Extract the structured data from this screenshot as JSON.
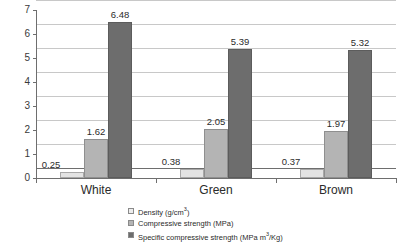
{
  "chart_data": {
    "type": "bar",
    "title": "",
    "xlabel": "",
    "ylabel": "",
    "ylim": [
      0,
      7
    ],
    "ytick_labels": [
      "0",
      "1",
      "2",
      "3",
      "4",
      "5",
      "6",
      "7"
    ],
    "grid": true,
    "legend_position": "bottom-center",
    "categories": [
      "White",
      "Green",
      "Brown"
    ],
    "series": [
      {
        "name": "Density (g/cm³)",
        "name_base": "Density (g/cm",
        "name_sup": "3",
        "name_tail": ")",
        "color": "#e3e3e3",
        "values": [
          0.25,
          0.38,
          0.37
        ],
        "labels": [
          "0.25",
          "0.38",
          "0.37"
        ]
      },
      {
        "name": "Compressive strength (MPa)",
        "name_base": "Compressive strength (MPa)",
        "name_sup": "",
        "name_tail": "",
        "color": "#b4b4b4",
        "values": [
          1.62,
          2.05,
          1.97
        ],
        "labels": [
          "1.62",
          "2.05",
          "1.97"
        ]
      },
      {
        "name": "Specific compressive strength (MPa m³/Kg)",
        "name_base": "Specific compressive strength (MPa m",
        "name_sup": "3",
        "name_tail": "/Kg)",
        "color": "#6d6d6d",
        "values": [
          6.48,
          5.39,
          5.32
        ],
        "labels": [
          "6.48",
          "5.39",
          "5.32"
        ]
      }
    ]
  },
  "axis": {
    "y_ticks": [
      "0",
      "1",
      "2",
      "3",
      "4",
      "5",
      "6",
      "7"
    ],
    "categories": [
      "White",
      "Green",
      "Brown"
    ]
  }
}
